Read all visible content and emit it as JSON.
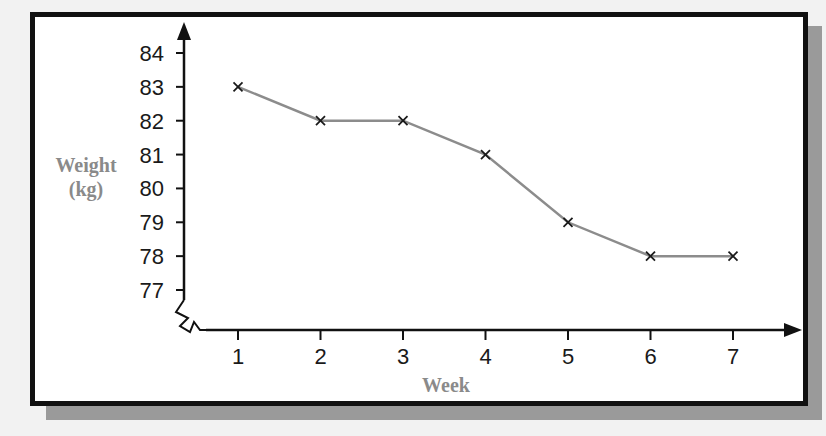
{
  "chart_data": {
    "type": "line",
    "title": "",
    "xlabel": "Week",
    "ylabel": "Weight (kg)",
    "ylabel_lines": [
      "Weight",
      "(kg)"
    ],
    "categories": [
      "1",
      "2",
      "3",
      "4",
      "5",
      "6",
      "7"
    ],
    "x": [
      1,
      2,
      3,
      4,
      5,
      6,
      7
    ],
    "series": [
      {
        "name": "Weight",
        "values": [
          83,
          82,
          82,
          81,
          79,
          78,
          78
        ],
        "marker": "x",
        "color": "#8c8c8c"
      }
    ],
    "y_ticks": [
      "84",
      "83",
      "82",
      "81",
      "80",
      "79",
      "78",
      "77"
    ],
    "ylim": [
      77,
      84
    ],
    "y_axis_break": true,
    "grid": false,
    "legend": "none"
  },
  "colors": {
    "line": "#8c8c8c",
    "marker": "#1a1a1a",
    "axis": "#111111",
    "axis_title": "#8a8a8a",
    "frame": "#111111",
    "shadow": "#9a9a9a"
  }
}
